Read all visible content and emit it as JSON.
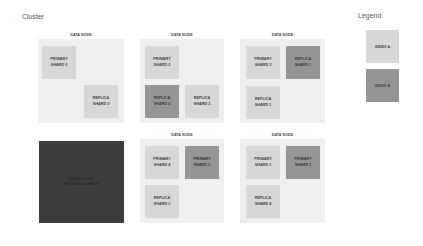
{
  "cluster": {
    "title": "Cluster",
    "nodes": [
      {
        "label": "DATA NODE",
        "shards": [
          {
            "text": "PRIMARY\nSHARD 0",
            "index": "A"
          },
          {
            "text": "REPLICA\nSHARD 2",
            "index": "A"
          }
        ]
      },
      {
        "label": "DATA NODE",
        "shards": [
          {
            "text": "PRIMARY\nSHARD 2",
            "index": "A"
          },
          {
            "text": "REPLICA\nSHARD 0",
            "index": "B"
          },
          {
            "text": "REPLICA\nSHARD 3",
            "index": "A"
          }
        ]
      },
      {
        "label": "DATA NODE",
        "shards": [
          {
            "text": "PRIMARY\nSHARD 3",
            "index": "A"
          },
          {
            "text": "REPLICA\nSHARD 1",
            "index": "B"
          },
          {
            "text": "REPLICA\nSHARD 1",
            "index": "A"
          }
        ]
      },
      {
        "label": "",
        "status": "down",
        "text": "NODE DOWN\nNETWORK ERROR"
      },
      {
        "label": "DATA NODE",
        "shards": [
          {
            "text": "PRIMARY\nSHARD 4",
            "index": "A"
          },
          {
            "text": "PRIMARY\nSHARD 0",
            "index": "B"
          },
          {
            "text": "REPLICA\nSHARD 0",
            "index": "A"
          }
        ]
      },
      {
        "label": "DATA NODE",
        "shards": [
          {
            "text": "PRIMARY\nSHARD 1",
            "index": "A"
          },
          {
            "text": "PRIMARY\nSHARD 1",
            "index": "B"
          },
          {
            "text": "REPLICA\nSHARD 4",
            "index": "A"
          }
        ]
      }
    ]
  },
  "legend": {
    "title": "Legend",
    "items": [
      {
        "label": "INDEX A",
        "color": "#d7d7d7"
      },
      {
        "label": "INDEX B",
        "color": "#959595"
      }
    ]
  },
  "colors": {
    "node_bg": "#efefef",
    "index_a": "#d7d7d7",
    "index_b": "#959595",
    "down_node": "#3d3d3d"
  }
}
